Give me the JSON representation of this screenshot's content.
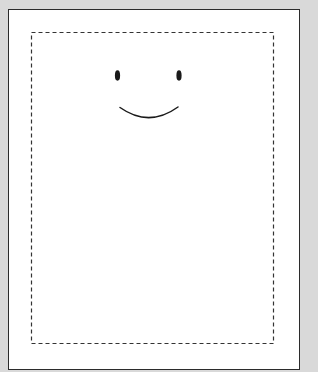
{
  "canvas": {
    "background_color": "#d9d9d9",
    "page_color": "#ffffff",
    "page_border_color": "#2b2b2b"
  },
  "safe_area": {
    "style": "dashed",
    "stroke_color": "#333333"
  },
  "drawing": {
    "subject": "smiley-face",
    "stroke_color": "#1a1a1a",
    "elements": [
      {
        "type": "left-eye",
        "shape": "ellipse"
      },
      {
        "type": "right-eye",
        "shape": "ellipse"
      },
      {
        "type": "mouth",
        "shape": "arc"
      }
    ]
  }
}
